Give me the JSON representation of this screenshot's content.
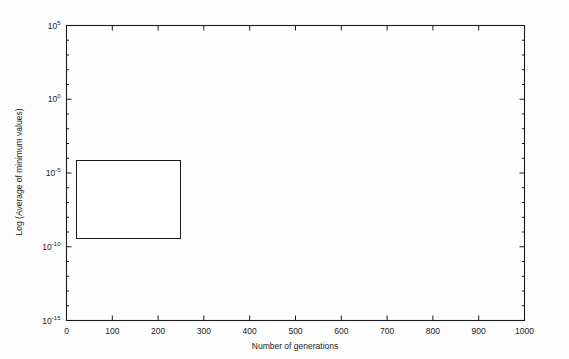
{
  "figure": {
    "background": "#fdfdfd",
    "ink_color": "#111111"
  },
  "chart_data": {
    "type": "line",
    "title": "",
    "xlabel": "Number of generations",
    "ylabel": "Log (Average of minimum values)",
    "yscale": "log",
    "xlim": [
      0,
      1000
    ],
    "ylim": [
      1e-15,
      100000.0
    ],
    "grid": false,
    "legend_position": "center-left",
    "xticks": [
      0,
      100,
      200,
      300,
      400,
      500,
      600,
      700,
      800,
      900,
      1000
    ],
    "xticklabels": [
      "0",
      "100",
      "200",
      "300",
      "400",
      "500",
      "600",
      "700",
      "800",
      "900",
      "1000"
    ],
    "yticks": [
      100000.0,
      1.0,
      1e-05,
      1e-10,
      1e-15
    ],
    "yticklabels": [
      "10^5",
      "10^0",
      "10^-5",
      "10^-10",
      "10^-15"
    ],
    "ytick_mantissa": [
      "10",
      "10",
      "10",
      "10",
      "10"
    ],
    "ytick_exponent": [
      "5",
      "0",
      "-5",
      "-10",
      "-15"
    ],
    "series": [
      {
        "name": "ABC",
        "style": "solid-thick",
        "x": [
          0,
          20,
          40,
          60,
          80,
          100,
          140,
          180,
          220,
          260,
          300,
          350,
          400,
          450,
          500,
          560,
          620,
          680,
          740,
          800,
          860,
          920,
          1000
        ],
        "y": [
          3000,
          900,
          400,
          230,
          150,
          105,
          62,
          42,
          31,
          24,
          19,
          14.5,
          11.5,
          9.3,
          7.8,
          6.4,
          5.4,
          4.6,
          4.0,
          3.5,
          3.1,
          2.8,
          2.4
        ]
      },
      {
        "name": "BABC1",
        "style": "dotted-thick",
        "x": [
          0,
          20,
          40,
          60,
          80,
          100,
          140,
          180,
          220,
          260,
          300,
          350,
          400,
          450,
          500,
          560,
          620,
          680,
          740,
          800,
          860,
          920,
          1000
        ],
        "y": [
          3000,
          750,
          300,
          160,
          98,
          66,
          36,
          23,
          15.5,
          11.2,
          8.4,
          6.0,
          4.5,
          3.5,
          2.8,
          2.2,
          1.85,
          1.6,
          1.45,
          1.33,
          1.24,
          1.17,
          1.1
        ]
      },
      {
        "name": "IABC",
        "style": "solid-thin",
        "x": [
          0,
          20,
          40,
          60,
          80,
          100,
          140,
          180,
          220,
          260,
          300,
          340,
          380,
          420,
          460,
          500,
          540,
          580,
          600,
          620,
          640,
          660,
          690,
          720,
          750,
          780,
          800,
          820,
          840,
          860,
          880,
          900,
          930,
          960,
          1000
        ],
        "y": [
          3000,
          800,
          330,
          175,
          108,
          72,
          39,
          25,
          17,
          12.2,
          9.0,
          7.0,
          5.5,
          4.3,
          3.4,
          2.7,
          2.1,
          1.6,
          1.2,
          0.35,
          0.09,
          0.03,
          0.012,
          0.0035,
          0.0011,
          0.00035,
          0.00012,
          4e-05,
          1.2e-05,
          3.5e-06,
          1.1e-06,
          3.5e-07,
          9e-08,
          2.5e-08,
          7e-09
        ]
      },
      {
        "name": "EABC",
        "style": "dotted-fine",
        "x": [
          0,
          20,
          40,
          60,
          80,
          100,
          140,
          180,
          220,
          260,
          300,
          340,
          380,
          420,
          460,
          480,
          500,
          520,
          540,
          570,
          600,
          630,
          660,
          680,
          700,
          730,
          760,
          790,
          820,
          850,
          880,
          910,
          950,
          1000
        ],
        "y": [
          3000,
          820,
          340,
          180,
          112,
          75,
          41,
          27,
          18.5,
          13.5,
          10.2,
          8.0,
          6.4,
          5.2,
          4.4,
          4.1,
          3.9,
          1.1,
          0.3,
          0.085,
          0.028,
          0.01,
          0.0045,
          0.0032,
          0.0024,
          0.0006,
          0.00012,
          3e-05,
          8e-06,
          2.2e-06,
          7e-07,
          2.2e-07,
          6e-08,
          1.6e-08
        ]
      },
      {
        "name": "JA-ABC5b",
        "style": "dash-dot",
        "x": [
          0,
          20,
          40,
          60,
          80,
          100,
          140,
          180,
          220,
          260,
          290,
          310,
          330,
          350,
          370,
          390,
          410,
          430,
          450,
          470,
          490,
          505,
          520,
          535,
          550,
          600,
          700,
          800,
          900,
          1000
        ],
        "y": [
          3000,
          500,
          150,
          62,
          32,
          19,
          8.5,
          4.6,
          2.7,
          1.6,
          1.05,
          0.28,
          0.07,
          0.017,
          0.0042,
          0.0011,
          0.00027,
          6.5e-05,
          1.5e-05,
          3.5e-06,
          6e-07,
          8e-09,
          2e-10,
          8e-12,
          1.6e-12,
          1e-12,
          8.5e-13,
          7.5e-13,
          6.8e-13,
          6.2e-13
        ]
      }
    ]
  },
  "legend": {
    "entries": [
      {
        "label": "ABC",
        "style": "solid-thick"
      },
      {
        "label": "BABC1",
        "style": "dotted-thick"
      },
      {
        "label": "IABC",
        "style": "solid-thin"
      },
      {
        "label": "EABC",
        "style": "dotted-fine"
      },
      {
        "label": "JA-ABC5b",
        "style": "dash-dot"
      }
    ]
  }
}
